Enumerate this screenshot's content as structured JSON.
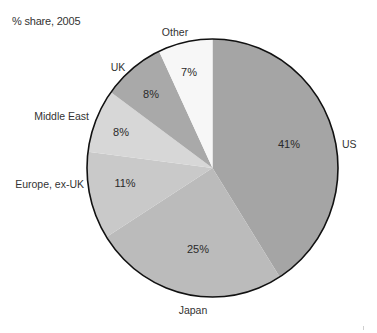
{
  "chart_data": {
    "type": "pie",
    "title": "% share, 2005",
    "start_angle": "12 o'clock",
    "direction": "clockwise",
    "categories": [
      "US",
      "Japan",
      "Europe, ex-UK",
      "Middle East",
      "UK",
      "Other"
    ],
    "values": [
      41,
      25,
      11,
      8,
      8,
      7
    ],
    "value_labels": [
      "41%",
      "25%",
      "11%",
      "8%",
      "8%",
      "7%"
    ],
    "colors": [
      "#a5a5a5",
      "#bbbbbb",
      "#c9c9c9",
      "#d7d7d7",
      "#a9a9a9",
      "#f7f7f7"
    ],
    "legend": "none (direct labels outside slices)"
  },
  "labels": {
    "us": "US",
    "japan": "Japan",
    "europe": "Europe, ex-UK",
    "middle_east": "Middle East",
    "uk": "UK",
    "other": "Other"
  },
  "pcts": {
    "us": "41%",
    "japan": "25%",
    "europe": "11%",
    "middle_east": "8%",
    "uk": "8%",
    "other": "7%"
  }
}
